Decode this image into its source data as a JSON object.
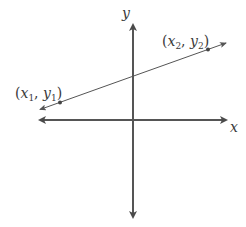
{
  "diagram": {
    "title": "",
    "axes": {
      "x_label": "x",
      "y_label": "y",
      "color": "#555555"
    },
    "line": {
      "color": "#555555",
      "points": [
        {
          "label_x": "x",
          "sub_x": "1",
          "label_y": "y",
          "sub_y": "1",
          "name": "(x1, y1)"
        },
        {
          "label_x": "x",
          "sub_x": "2",
          "label_y": "y",
          "sub_y": "2",
          "name": "(x2, y2)"
        }
      ]
    },
    "punct": {
      "open": "(",
      "comma": ", ",
      "close": ")"
    }
  }
}
